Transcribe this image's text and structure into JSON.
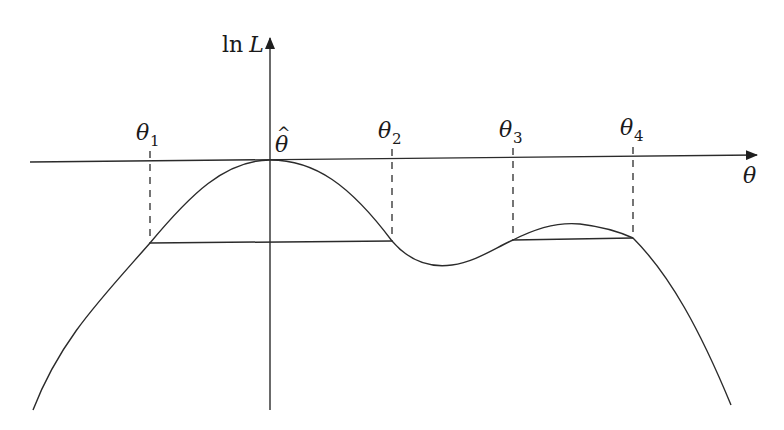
{
  "diagram": {
    "type": "log-likelihood curve with confidence intervals",
    "y_axis": {
      "label_fn": "ln",
      "label_var": "L"
    },
    "x_axis": {
      "label": "θ"
    },
    "peak_label": {
      "base": "θ",
      "hat": "^"
    },
    "marks": [
      {
        "base": "θ",
        "sub": "1",
        "x": 150
      },
      {
        "base": "θ",
        "sub": "2",
        "x": 392
      },
      {
        "base": "θ",
        "sub": "3",
        "x": 513
      },
      {
        "base": "θ",
        "sub": "4",
        "x": 633
      }
    ],
    "chords": [
      {
        "from": "θ1",
        "to": "θ2"
      },
      {
        "from": "θ3",
        "to": "θ4"
      }
    ],
    "colors": {
      "line": "#2b2b2b",
      "background": "#ffffff"
    }
  }
}
